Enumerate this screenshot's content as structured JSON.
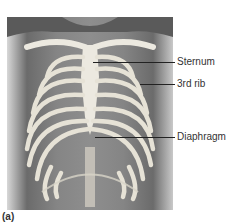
{
  "figure": {
    "caption": "(a)",
    "labels": [
      {
        "text": "Sternum",
        "y": 62
      },
      {
        "text": "3rd rib",
        "y": 84
      },
      {
        "text": "Diaphragm",
        "y": 137
      }
    ]
  },
  "colors": {
    "bone": "#e9e6dc",
    "skin": "#7d7d7d",
    "leader": "#222222",
    "text": "#333333"
  }
}
